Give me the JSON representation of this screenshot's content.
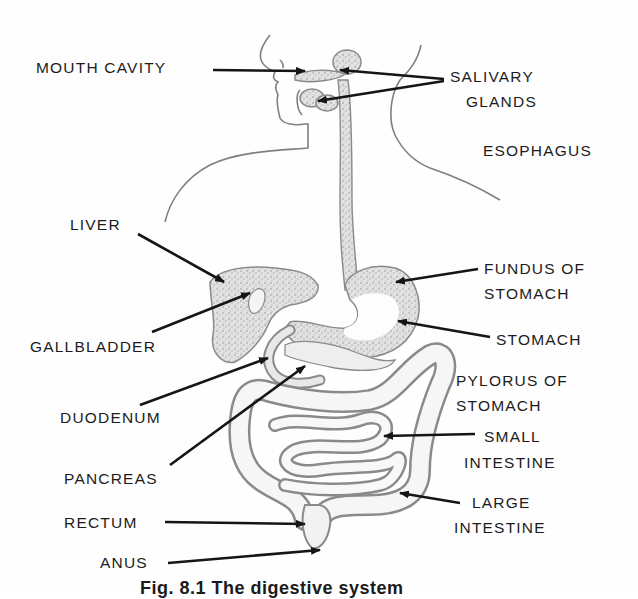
{
  "figure": {
    "caption": "Fig. 8.1 The digestive system",
    "colors": {
      "organ_fill": "#d9d9d9",
      "organ_stroke": "#8a8a8a",
      "arrow": "#151515",
      "text": "#1c1c1c",
      "outline": "#7f7f7f"
    }
  },
  "labels": {
    "mouth_cavity": "MOUTH CAVITY",
    "salivary_glands_1": "SALIVARY",
    "salivary_glands_2": "GLANDS",
    "esophagus": "ESOPHAGUS",
    "liver": "LIVER",
    "gallbladder": "GALLBLADDER",
    "duodenum": "DUODENUM",
    "pancreas": "PANCREAS",
    "rectum": "RECTUM",
    "anus": "ANUS",
    "fundus_1": "FUNDUS OF",
    "fundus_2": "STOMACH",
    "stomach": "STOMACH",
    "pylorus_1": "PYLORUS OF",
    "pylorus_2": "STOMACH",
    "small_intestine_1": "SMALL",
    "small_intestine_2": "INTESTINE",
    "large_intestine_1": "LARGE",
    "large_intestine_2": "INTESTINE"
  }
}
